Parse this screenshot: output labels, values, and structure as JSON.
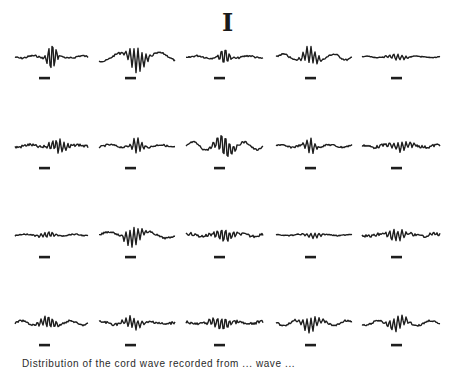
{
  "figure": {
    "title": "I",
    "caption": "Distribution of the cord wave recorded from ... wave ... ",
    "ink_color": "#1e1e1e",
    "layout": {
      "rows": 4,
      "columns": 5
    },
    "rows": [
      {
        "baseline_y": 57,
        "scale_bar_y": 78
      },
      {
        "baseline_y": 146,
        "scale_bar_y": 168
      },
      {
        "baseline_y": 235,
        "scale_bar_y": 257
      },
      {
        "baseline_y": 323,
        "scale_bar_y": 345
      }
    ],
    "columns": [
      {
        "x_start": 15,
        "x_end": 88,
        "scale_bar_x": 44
      },
      {
        "x_start": 99,
        "x_end": 175,
        "scale_bar_x": 130
      },
      {
        "x_start": 186,
        "x_end": 263,
        "scale_bar_x": 219
      },
      {
        "x_start": 276,
        "x_end": 352,
        "scale_bar_x": 310
      },
      {
        "x_start": 362,
        "x_end": 440,
        "scale_bar_x": 396
      }
    ],
    "traces": [
      [
        {
          "peak": 0.5,
          "amp": 14,
          "style": "spike"
        },
        {
          "peak": 0.5,
          "amp": 12,
          "style": "slow"
        },
        {
          "peak": 0.5,
          "amp": 9,
          "style": "spike"
        },
        {
          "peak": 0.45,
          "amp": 8,
          "style": "wave"
        },
        {
          "peak": 0.45,
          "amp": 5,
          "style": "flat"
        }
      ],
      [
        {
          "peak": 0.6,
          "amp": 7,
          "style": "noisy"
        },
        {
          "peak": 0.5,
          "amp": 8,
          "style": "spike"
        },
        {
          "peak": 0.5,
          "amp": 11,
          "style": "wave"
        },
        {
          "peak": 0.45,
          "amp": 8,
          "style": "spike"
        },
        {
          "peak": 0.5,
          "amp": 5,
          "style": "noisy"
        }
      ],
      [
        {
          "peak": 0.45,
          "amp": 5,
          "style": "flat"
        },
        {
          "peak": 0.45,
          "amp": 9,
          "style": "slow"
        },
        {
          "peak": 0.5,
          "amp": 6,
          "style": "noisy"
        },
        {
          "peak": 0.5,
          "amp": 4,
          "style": "flat"
        },
        {
          "peak": 0.45,
          "amp": 6,
          "style": "noisy"
        }
      ],
      [
        {
          "peak": 0.45,
          "amp": 6,
          "style": "wave"
        },
        {
          "peak": 0.45,
          "amp": 6,
          "style": "noisy"
        },
        {
          "peak": 0.45,
          "amp": 6,
          "style": "noisy"
        },
        {
          "peak": 0.45,
          "amp": 7,
          "style": "wave"
        },
        {
          "peak": 0.45,
          "amp": 7,
          "style": "wave"
        }
      ]
    ]
  }
}
